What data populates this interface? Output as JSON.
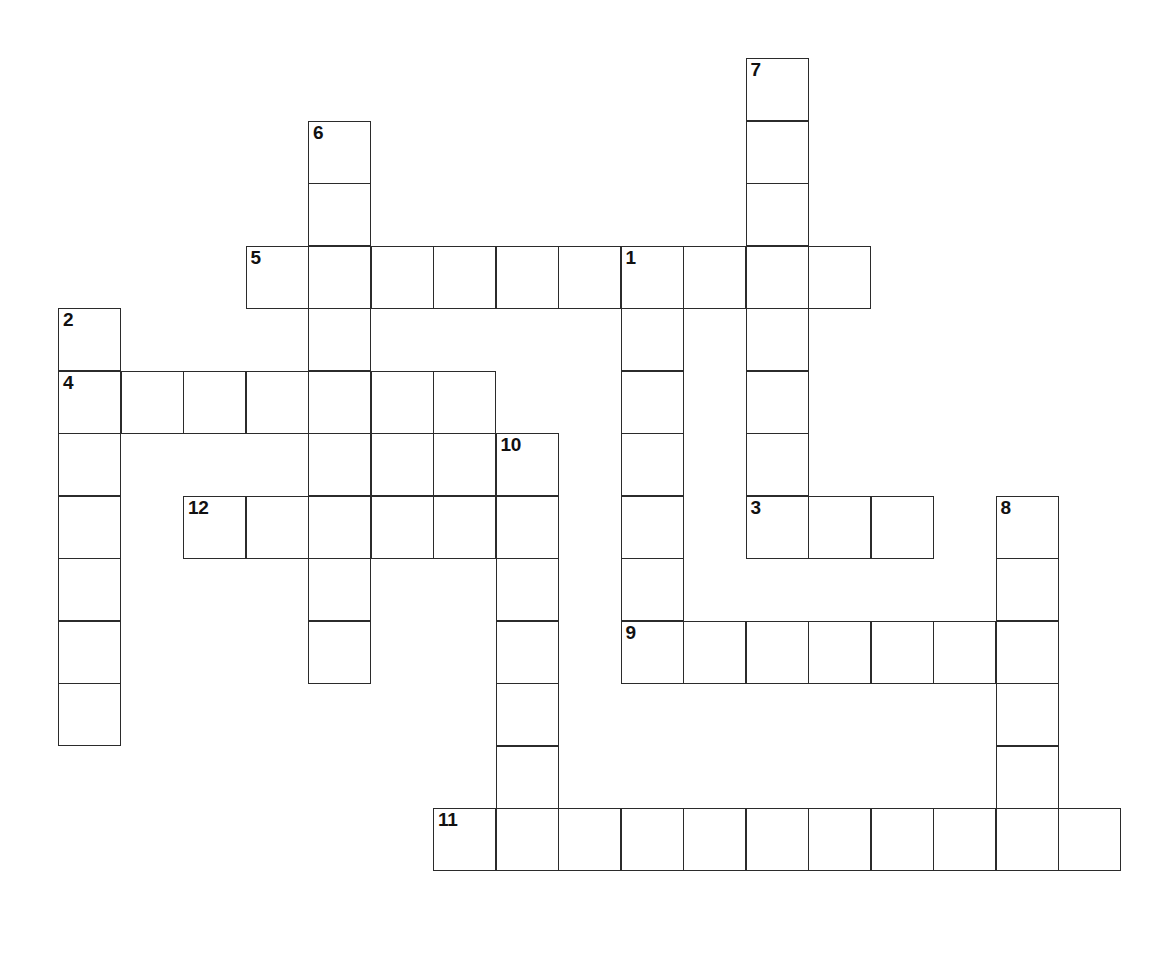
{
  "puzzle": {
    "type": "crossword-grid",
    "title": "",
    "background_color": "#ffffff",
    "cell_border_color": "#2b2b2b",
    "cell_fill_color": "#ffffff",
    "number_color": "#111111",
    "cell_size_px": 63,
    "grid_origin": {
      "x": 58,
      "y": 58
    },
    "grid_columns": 17,
    "grid_rows": 14,
    "entry_count": 12,
    "entries": [
      {
        "number": "1",
        "direction": "down",
        "row": 3,
        "col": 9,
        "length": 7
      },
      {
        "number": "2",
        "direction": "down",
        "row": 4,
        "col": 0,
        "length": 7
      },
      {
        "number": "3",
        "direction": "across",
        "row": 7,
        "col": 11,
        "length": 3
      },
      {
        "number": "4",
        "direction": "across",
        "row": 5,
        "col": 0,
        "length": 7
      },
      {
        "number": "5",
        "direction": "across",
        "row": 3,
        "col": 3,
        "length": 10
      },
      {
        "number": "6",
        "direction": "down",
        "row": 1,
        "col": 4,
        "length": 10
      },
      {
        "number": "7",
        "direction": "down",
        "row": 0,
        "col": 11,
        "length": 8
      },
      {
        "number": "8",
        "direction": "down",
        "row": 7,
        "col": 15,
        "length": 6
      },
      {
        "number": "9",
        "direction": "across",
        "row": 9,
        "col": 9,
        "length": 7
      },
      {
        "number": "10",
        "direction": "down",
        "row": 6,
        "col": 7,
        "length": 5
      },
      {
        "number": "11",
        "direction": "across",
        "row": 12,
        "col": 6,
        "length": 11
      },
      {
        "number": "12",
        "direction": "across",
        "row": 7,
        "col": 2,
        "length": 6
      }
    ],
    "cells": [
      {
        "row": 0,
        "col": 11,
        "number": "7"
      },
      {
        "row": 1,
        "col": 4,
        "number": "6"
      },
      {
        "row": 1,
        "col": 11,
        "number": ""
      },
      {
        "row": 2,
        "col": 4,
        "number": ""
      },
      {
        "row": 2,
        "col": 11,
        "number": ""
      },
      {
        "row": 3,
        "col": 3,
        "number": "5"
      },
      {
        "row": 3,
        "col": 4,
        "number": ""
      },
      {
        "row": 3,
        "col": 5,
        "number": ""
      },
      {
        "row": 3,
        "col": 6,
        "number": ""
      },
      {
        "row": 3,
        "col": 7,
        "number": ""
      },
      {
        "row": 3,
        "col": 8,
        "number": ""
      },
      {
        "row": 3,
        "col": 9,
        "number": "1"
      },
      {
        "row": 3,
        "col": 10,
        "number": ""
      },
      {
        "row": 3,
        "col": 11,
        "number": ""
      },
      {
        "row": 3,
        "col": 12,
        "number": ""
      },
      {
        "row": 4,
        "col": 0,
        "number": "2"
      },
      {
        "row": 4,
        "col": 4,
        "number": ""
      },
      {
        "row": 4,
        "col": 9,
        "number": ""
      },
      {
        "row": 4,
        "col": 11,
        "number": ""
      },
      {
        "row": 5,
        "col": 0,
        "number": "4"
      },
      {
        "row": 5,
        "col": 1,
        "number": ""
      },
      {
        "row": 5,
        "col": 2,
        "number": ""
      },
      {
        "row": 5,
        "col": 3,
        "number": ""
      },
      {
        "row": 5,
        "col": 4,
        "number": ""
      },
      {
        "row": 5,
        "col": 5,
        "number": ""
      },
      {
        "row": 5,
        "col": 6,
        "number": ""
      },
      {
        "row": 5,
        "col": 9,
        "number": ""
      },
      {
        "row": 5,
        "col": 11,
        "number": ""
      },
      {
        "row": 6,
        "col": 0,
        "number": ""
      },
      {
        "row": 6,
        "col": 4,
        "number": ""
      },
      {
        "row": 6,
        "col": 5,
        "number": ""
      },
      {
        "row": 6,
        "col": 6,
        "number": ""
      },
      {
        "row": 6,
        "col": 7,
        "number": "10"
      },
      {
        "row": 6,
        "col": 9,
        "number": ""
      },
      {
        "row": 6,
        "col": 11,
        "number": ""
      },
      {
        "row": 7,
        "col": 0,
        "number": ""
      },
      {
        "row": 7,
        "col": 2,
        "number": "12"
      },
      {
        "row": 7,
        "col": 3,
        "number": ""
      },
      {
        "row": 7,
        "col": 4,
        "number": ""
      },
      {
        "row": 7,
        "col": 5,
        "number": ""
      },
      {
        "row": 7,
        "col": 6,
        "number": ""
      },
      {
        "row": 7,
        "col": 7,
        "number": ""
      },
      {
        "row": 7,
        "col": 9,
        "number": ""
      },
      {
        "row": 7,
        "col": 11,
        "number": "3"
      },
      {
        "row": 7,
        "col": 12,
        "number": ""
      },
      {
        "row": 7,
        "col": 13,
        "number": ""
      },
      {
        "row": 7,
        "col": 15,
        "number": "8"
      },
      {
        "row": 8,
        "col": 0,
        "number": ""
      },
      {
        "row": 8,
        "col": 4,
        "number": ""
      },
      {
        "row": 8,
        "col": 7,
        "number": ""
      },
      {
        "row": 8,
        "col": 9,
        "number": ""
      },
      {
        "row": 8,
        "col": 15,
        "number": ""
      },
      {
        "row": 9,
        "col": 0,
        "number": ""
      },
      {
        "row": 9,
        "col": 4,
        "number": ""
      },
      {
        "row": 9,
        "col": 7,
        "number": ""
      },
      {
        "row": 9,
        "col": 9,
        "number": "9"
      },
      {
        "row": 9,
        "col": 10,
        "number": ""
      },
      {
        "row": 9,
        "col": 11,
        "number": ""
      },
      {
        "row": 9,
        "col": 12,
        "number": ""
      },
      {
        "row": 9,
        "col": 13,
        "number": ""
      },
      {
        "row": 9,
        "col": 14,
        "number": ""
      },
      {
        "row": 9,
        "col": 15,
        "number": ""
      },
      {
        "row": 10,
        "col": 0,
        "number": ""
      },
      {
        "row": 10,
        "col": 7,
        "number": ""
      },
      {
        "row": 10,
        "col": 15,
        "number": ""
      },
      {
        "row": 11,
        "col": 7,
        "number": ""
      },
      {
        "row": 11,
        "col": 15,
        "number": ""
      },
      {
        "row": 12,
        "col": 6,
        "number": "11"
      },
      {
        "row": 12,
        "col": 7,
        "number": ""
      },
      {
        "row": 12,
        "col": 8,
        "number": ""
      },
      {
        "row": 12,
        "col": 9,
        "number": ""
      },
      {
        "row": 12,
        "col": 10,
        "number": ""
      },
      {
        "row": 12,
        "col": 11,
        "number": ""
      },
      {
        "row": 12,
        "col": 12,
        "number": ""
      },
      {
        "row": 12,
        "col": 13,
        "number": ""
      },
      {
        "row": 12,
        "col": 14,
        "number": ""
      },
      {
        "row": 12,
        "col": 15,
        "number": ""
      },
      {
        "row": 12,
        "col": 16,
        "number": ""
      }
    ]
  }
}
